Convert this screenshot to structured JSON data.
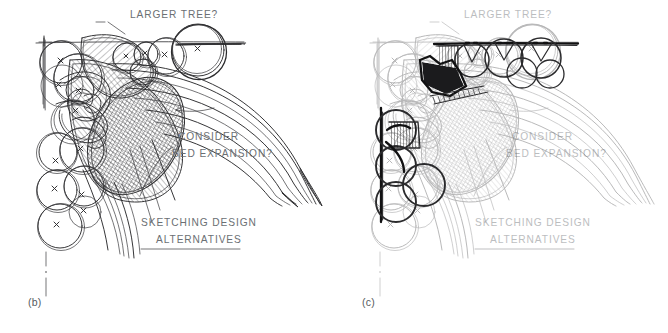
{
  "figure": {
    "title": "Sketching Design Alternatives",
    "medium": "hand-drawn pen sketch / landscape planting plan",
    "background_color": "#ffffff",
    "ink_color": "#2b2b2d",
    "bold_ink_color": "#111112",
    "annotation_color": "#6b6f73",
    "faded_ink_color": "#9aa0a4"
  },
  "panels": [
    {
      "id": "b",
      "caption": "(b)",
      "annotations": [
        {
          "name": "larger-tree-note",
          "text": "LARGER TREE?",
          "leader": true
        },
        {
          "name": "consider-bed-expansion-note",
          "line1": "CONSIDER",
          "line2": "BED EXPANSION?",
          "leader": true
        }
      ],
      "title_block": {
        "line1": "SKETCHING DESIGN",
        "line2": "ALTERNATIVES",
        "underlined": true
      },
      "elements": {
        "plant_symbols": 18,
        "hatched_beds": 3,
        "sweeping_arcs": 7,
        "centerline": "dash-dot vertical",
        "overlay_emphasis": "none"
      }
    },
    {
      "id": "c",
      "caption": "(c)",
      "annotations": [
        {
          "name": "larger-tree-note",
          "text": "LARGER TREE?",
          "leader": true
        },
        {
          "name": "consider-bed-expansion-note",
          "line1": "CONSIDER",
          "line2": "BED EXPANSION?",
          "leader": true
        }
      ],
      "title_block": {
        "line1": "SKETCHING DESIGN",
        "line2": "ALTERNATIVES",
        "underlined": true
      },
      "elements": {
        "plant_symbols": 18,
        "hatched_beds": 5,
        "sweeping_arcs": 7,
        "centerline": "dash-dot vertical",
        "overlay_emphasis": "bold black revision overlay: top edge line, new tree circles, vertical bed edge, dark infill wedge"
      }
    }
  ]
}
